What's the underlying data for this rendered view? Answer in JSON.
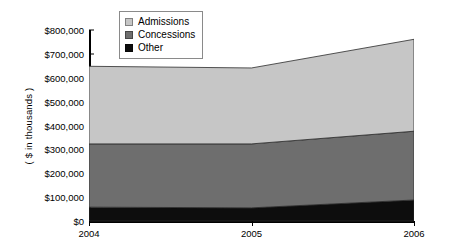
{
  "chart_data": {
    "type": "area",
    "stacked": true,
    "title": "",
    "xlabel": "",
    "ylabel": "( $ in thousands )",
    "categories": [
      "2004",
      "2005",
      "2006"
    ],
    "x_tick_labels": [
      "2004",
      "2005",
      "2006"
    ],
    "y_tick_labels": [
      "$0",
      "$100,000",
      "$200,000",
      "$300,000",
      "$400,000",
      "$500,000",
      "$600,000",
      "$700,000",
      "$800,000"
    ],
    "y_tick_values": [
      0,
      100000,
      200000,
      300000,
      400000,
      500000,
      600000,
      700000,
      800000
    ],
    "ylim": [
      0,
      800000
    ],
    "grid": false,
    "legend_position": "top-center",
    "series": [
      {
        "name": "Admissions",
        "color": "#c6c6c6",
        "values": [
          325000,
          318000,
          385000
        ]
      },
      {
        "name": "Concessions",
        "color": "#6e6e6e",
        "values": [
          265000,
          268000,
          288000
        ]
      },
      {
        "name": "Other",
        "color": "#0d0d0d",
        "values": [
          58000,
          55000,
          88000
        ]
      }
    ],
    "stack_order_bottom_to_top": [
      "Other",
      "Concessions",
      "Admissions"
    ],
    "cumulative_totals": [
      648000,
      641000,
      761000
    ]
  },
  "legend": {
    "items": [
      {
        "label": "Admissions",
        "color": "#c6c6c6"
      },
      {
        "label": "Concessions",
        "color": "#6e6e6e"
      },
      {
        "label": "Other",
        "color": "#0d0d0d"
      }
    ]
  }
}
